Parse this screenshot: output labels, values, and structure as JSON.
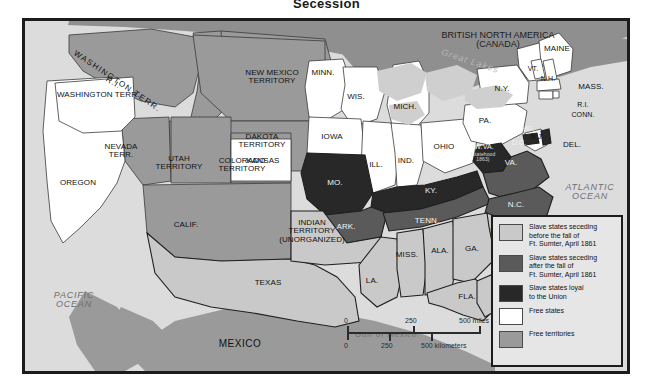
{
  "title": "Secession",
  "map": {
    "oceans": [
      {
        "name": "pacific-ocean",
        "label": "PACIFIC\nOCEAN"
      },
      {
        "name": "atlantic-ocean",
        "label": "ATLANTIC\nOCEAN"
      },
      {
        "name": "gulf-of-mexico",
        "label": "Gulf of Mexico"
      },
      {
        "name": "great-lakes",
        "label": "Great Lakes"
      }
    ],
    "countries": [
      {
        "name": "canada",
        "label": "BRITISH NORTH AMERICA\n(CANADA)"
      },
      {
        "name": "mexico",
        "label": "MEXICO"
      }
    ],
    "regions": [
      {
        "name": "washington-territory",
        "label": "WASHINGTON TERR.",
        "category": "free-territory"
      },
      {
        "name": "oregon",
        "label": "OREGON",
        "category": "free-state"
      },
      {
        "name": "california",
        "label": "CALIF.",
        "category": "free-state"
      },
      {
        "name": "nevada-territory",
        "label": "NEVADA\nTERR.",
        "category": "free-territory"
      },
      {
        "name": "utah-territory",
        "label": "UTAH\nTERRITORY",
        "category": "free-territory"
      },
      {
        "name": "colorado-territory",
        "label": "COLORADO\nTERRITORY",
        "category": "free-territory"
      },
      {
        "name": "new-mexico-territory",
        "label": "NEW MEXICO\nTERRITORY",
        "category": "free-territory"
      },
      {
        "name": "dakota-territory",
        "label": "DAKOTA\nTERRITORY",
        "category": "free-territory"
      },
      {
        "name": "nebraska-territory",
        "label": "NEBRASKA TERRITORY",
        "category": "free-territory"
      },
      {
        "name": "indian-territory",
        "label": "INDIAN\nTERRITORY\n(UNORGANIZED)",
        "category": "seceded-before"
      },
      {
        "name": "kansas",
        "label": "KANSAS",
        "category": "free-state"
      },
      {
        "name": "minnesota",
        "label": "MINN.",
        "category": "free-state"
      },
      {
        "name": "wisconsin",
        "label": "WIS.",
        "category": "free-state"
      },
      {
        "name": "iowa",
        "label": "IOWA",
        "category": "free-state"
      },
      {
        "name": "michigan",
        "label": "MICH.",
        "category": "free-state"
      },
      {
        "name": "illinois",
        "label": "ILL.",
        "category": "free-state"
      },
      {
        "name": "indiana",
        "label": "IND.",
        "category": "free-state"
      },
      {
        "name": "ohio",
        "label": "OHIO",
        "category": "free-state"
      },
      {
        "name": "missouri",
        "label": "MO.",
        "category": "slave-loyal"
      },
      {
        "name": "kentucky",
        "label": "KY.",
        "category": "slave-loyal"
      },
      {
        "name": "arkansas",
        "label": "ARK.",
        "category": "seceded-after"
      },
      {
        "name": "tennessee",
        "label": "TENN.",
        "category": "seceded-after"
      },
      {
        "name": "louisiana",
        "label": "LA.",
        "category": "seceded-before"
      },
      {
        "name": "mississippi",
        "label": "MISS.",
        "category": "seceded-before"
      },
      {
        "name": "alabama",
        "label": "ALA.",
        "category": "seceded-before"
      },
      {
        "name": "georgia",
        "label": "GA.",
        "category": "seceded-before"
      },
      {
        "name": "florida",
        "label": "FLA.",
        "category": "seceded-before"
      },
      {
        "name": "south-carolina",
        "label": "S.C.",
        "category": "seceded-before"
      },
      {
        "name": "north-carolina",
        "label": "N.C.",
        "category": "seceded-after"
      },
      {
        "name": "virginia",
        "label": "VA.",
        "category": "seceded-after"
      },
      {
        "name": "west-virginia",
        "label": "W.VA.",
        "category": "slave-loyal"
      },
      {
        "name": "west-virginia-statehood",
        "label": "(statehood\n1863)",
        "category": "annotation"
      },
      {
        "name": "maryland",
        "label": "MD.",
        "category": "slave-loyal"
      },
      {
        "name": "district-of-columbia",
        "label": "D.C.",
        "category": "slave-loyal"
      },
      {
        "name": "delaware",
        "label": "DEL.",
        "category": "slave-loyal"
      },
      {
        "name": "pennsylvania",
        "label": "PA.",
        "category": "free-state"
      },
      {
        "name": "new-jersey",
        "label": "N.J.",
        "category": "free-state"
      },
      {
        "name": "new-york",
        "label": "N.Y.",
        "category": "free-state"
      },
      {
        "name": "texas",
        "label": "TEXAS",
        "category": "seceded-before"
      },
      {
        "name": "maine",
        "label": "MAINE",
        "category": "free-state"
      },
      {
        "name": "vermont",
        "label": "VT.",
        "category": "free-state"
      },
      {
        "name": "new-hampshire",
        "label": "N.H.",
        "category": "free-state"
      },
      {
        "name": "massachusetts",
        "label": "MASS.",
        "category": "free-state"
      },
      {
        "name": "rhode-island",
        "label": "R.I.",
        "category": "free-state"
      },
      {
        "name": "connecticut",
        "label": "CONN.",
        "category": "free-state"
      }
    ],
    "landmark": {
      "name": "fort-sumter",
      "label": "Ft.\nSumter"
    }
  },
  "legend": {
    "items": [
      {
        "key": "seceded-before",
        "color": "#c9c9c9",
        "label": "Slave states seceding\nbefore the fall of\nFt. Sumter, April 1861"
      },
      {
        "key": "seceded-after",
        "color": "#5a5a5a",
        "label": "Slave states seceding\nafter the fall of\nFt. Sumter, April 1861"
      },
      {
        "key": "slave-loyal",
        "color": "#282828",
        "label": "Slave states loyal\nto the Union"
      },
      {
        "key": "free-state",
        "color": "#ffffff",
        "label": "Free states"
      },
      {
        "key": "free-territory",
        "color": "#9a9a9a",
        "label": "Free territories"
      }
    ]
  },
  "scale": {
    "miles": {
      "zero": "0",
      "mid": "250",
      "max": "500 miles"
    },
    "kilometers": {
      "zero": "0",
      "mid": "250",
      "max": "500 kilometers"
    }
  },
  "colors": {
    "seceded_before": "#c9c9c9",
    "seceded_after": "#5a5a5a",
    "slave_loyal": "#282828",
    "free_state": "#ffffff",
    "free_territory": "#9a9a9a",
    "ocean": "#dcdcdc",
    "canada": "#8f8f8f",
    "mexico": "#9a9a9a",
    "border": "#1c1c1c"
  }
}
